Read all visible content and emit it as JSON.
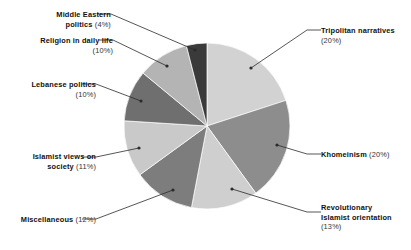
{
  "chart_data": {
    "type": "pie",
    "title": "",
    "subtitle": "",
    "xlabel": "",
    "ylabel": "",
    "legend_position": "callout-labels",
    "grid": false,
    "start_angle_deg": 0,
    "direction": "clockwise",
    "center": {
      "x": 207,
      "y": 126
    },
    "radius": 83,
    "categories": [
      "Tripolitan narratives",
      "Khomeinism",
      "Revolutionary Islamist orientation",
      "Miscellaneous",
      "Islamist views on society",
      "Lebanese politics",
      "Religion in daily life",
      "Middle Eastern politics"
    ],
    "values": [
      20,
      20,
      13,
      12,
      11,
      10,
      10,
      4
    ],
    "value_suffix": "%",
    "colors": [
      "#d2d2d2",
      "#8d8d8d",
      "#cfcfcf",
      "#7d7d7d",
      "#c9c9c9",
      "#6f6f6f",
      "#b4b4b4",
      "#3a3a3a"
    ],
    "slices": [
      {
        "label": "Tripolitan narratives",
        "value": 20,
        "text": "Tripolitan narratives",
        "pct_text": "(20%)",
        "color": "#d2d2d2",
        "start_deg": 0,
        "end_deg": 72,
        "side": "right",
        "label_x": 321,
        "label_y": 26,
        "dot_x": 251,
        "dot_y": 68,
        "elbow_x": 307,
        "elbow_y": 30
      },
      {
        "label": "Khomeinism",
        "value": 20,
        "text": "Khomeinism",
        "pct_text": "(20%)",
        "color": "#8d8d8d",
        "start_deg": 72,
        "end_deg": 144,
        "side": "right",
        "label_x": 321,
        "label_y": 150,
        "dot_x": 277,
        "dot_y": 145,
        "elbow_x": 307,
        "elbow_y": 154
      },
      {
        "label": "Revolutionary Islamist orientation",
        "value": 13,
        "text": "Revolutionary\nIslamist orientation",
        "pct_text": "(13%)",
        "color": "#cfcfcf",
        "start_deg": 144,
        "end_deg": 190.8,
        "side": "right",
        "label_x": 321,
        "label_y": 203,
        "dot_x": 232,
        "dot_y": 189,
        "elbow_x": 307,
        "elbow_y": 212
      },
      {
        "label": "Miscellaneous",
        "value": 12,
        "text": "Miscellaneous",
        "pct_text": "(12%)",
        "color": "#7d7d7d",
        "start_deg": 190.8,
        "end_deg": 234,
        "side": "left",
        "label_x": 7,
        "label_y": 215,
        "dot_x": 173,
        "dot_y": 190,
        "elbow_x": 96,
        "elbow_y": 219
      },
      {
        "label": "Islamist views on society",
        "value": 11,
        "text": "Islamist views on\nsociety",
        "pct_text": "(11%)",
        "color": "#c9c9c9",
        "start_deg": 234,
        "end_deg": 273.6,
        "side": "left",
        "label_x": 7,
        "label_y": 152,
        "dot_x": 139,
        "dot_y": 148,
        "elbow_x": 96,
        "elbow_y": 157
      },
      {
        "label": "Lebanese politics",
        "value": 10,
        "text": "Lebanese politics",
        "pct_text": "(10%)",
        "color": "#6f6f6f",
        "start_deg": 273.6,
        "end_deg": 309.6,
        "side": "left",
        "label_x": 7,
        "label_y": 80,
        "dot_x": 141,
        "dot_y": 101,
        "elbow_x": 96,
        "elbow_y": 84
      },
      {
        "label": "Religion in daily life",
        "value": 10,
        "text": "Religion in daily life",
        "pct_text": "(10%)",
        "color": "#b4b4b4",
        "start_deg": 309.6,
        "end_deg": 345.6,
        "side": "left",
        "label_x": 7,
        "label_y": 36,
        "dot_x": 167,
        "dot_y": 66,
        "elbow_x": 113,
        "elbow_y": 40
      },
      {
        "label": "Middle Eastern politics",
        "value": 4,
        "text": "Middle Eastern\npolitics",
        "pct_text": "(4%)",
        "color": "#3a3a3a",
        "start_deg": 345.6,
        "end_deg": 360,
        "side": "left",
        "label_x": 7,
        "label_y": 10,
        "dot_x": 195,
        "dot_y": 50,
        "elbow_x": 111,
        "elbow_y": 14
      }
    ]
  },
  "labels": {
    "tripolitan_narratives": {
      "name": "Tripolitan narratives",
      "pct": "(20%)"
    },
    "khomeinism": {
      "name": "Khomeinism",
      "pct": "(20%)"
    },
    "revolutionary_line1": "Revolutionary",
    "revolutionary_line2": "Islamist orientation",
    "revolutionary_pct": "(13%)",
    "miscellaneous": {
      "name": "Miscellaneous",
      "pct": "(12%)"
    },
    "islamist_views_line1": "Islamist views on",
    "islamist_views_line2": "society",
    "islamist_views_pct": "(11%)",
    "lebanese_politics": {
      "name": "Lebanese politics",
      "pct": "(10%)"
    },
    "religion_daily_life": {
      "name": "Religion in daily life",
      "pct": "(10%)"
    },
    "middle_eastern_line1": "Middle Eastern",
    "middle_eastern_line2": "politics",
    "middle_eastern_pct": "(4%)"
  },
  "style": {
    "background": "#ffffff",
    "leader_line_color": "#2b2b2b",
    "text_color": "#1a1a1a"
  }
}
